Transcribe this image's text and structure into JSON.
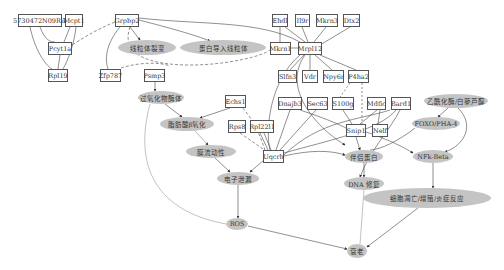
{
  "diagram": {
    "gene_nodes": [
      {
        "id": "n5730",
        "label": "5730472N09Rik",
        "x": 18,
        "y": 14,
        "w": 44
      },
      {
        "id": "mcpt1",
        "label": "Mcpt1",
        "x": 65,
        "y": 14,
        "w": 17
      },
      {
        "id": "pcyt1a",
        "label": "Pcyt1a",
        "x": 48,
        "y": 42,
        "w": 24
      },
      {
        "id": "rpl19",
        "label": "Rpl19",
        "x": 48,
        "y": 69,
        "w": 20
      },
      {
        "id": "grpbp2",
        "label": "Grpbp2",
        "x": 115,
        "y": 14,
        "w": 24
      },
      {
        "id": "zfp787",
        "label": "Zfp787",
        "x": 100,
        "y": 69,
        "w": 21
      },
      {
        "id": "psmp3",
        "label": "Psmp3",
        "x": 144,
        "y": 69,
        "w": 21
      },
      {
        "id": "ehdl",
        "label": "Ehdl",
        "x": 272,
        "y": 14,
        "w": 16
      },
      {
        "id": "il9r",
        "label": "Il9r",
        "x": 295,
        "y": 14,
        "w": 15
      },
      {
        "id": "mkrn3",
        "label": "Mkrn3",
        "x": 316,
        "y": 14,
        "w": 22
      },
      {
        "id": "dtx2",
        "label": "Dtx2",
        "x": 343,
        "y": 14,
        "w": 17
      },
      {
        "id": "mkrn1",
        "label": "Mkrn1",
        "x": 270,
        "y": 42,
        "w": 21
      },
      {
        "id": "mrpl12",
        "label": "Mrpl12",
        "x": 298,
        "y": 42,
        "w": 24
      },
      {
        "id": "slfn3",
        "label": "Slfn3",
        "x": 278,
        "y": 70,
        "w": 19
      },
      {
        "id": "vdr",
        "label": "Vdr",
        "x": 302,
        "y": 70,
        "w": 16
      },
      {
        "id": "npy6r",
        "label": "Npy6r",
        "x": 323,
        "y": 70,
        "w": 21
      },
      {
        "id": "p4ha2",
        "label": "P4ha2",
        "x": 348,
        "y": 70,
        "w": 21
      },
      {
        "id": "echs1",
        "label": "Echs1",
        "x": 225,
        "y": 95,
        "w": 21
      },
      {
        "id": "dnajb3",
        "label": "Dnajb3",
        "x": 278,
        "y": 97,
        "w": 24
      },
      {
        "id": "sec63",
        "label": "Sec63",
        "x": 307,
        "y": 97,
        "w": 21
      },
      {
        "id": "s100g",
        "label": "S100g",
        "x": 332,
        "y": 97,
        "w": 22
      },
      {
        "id": "mdfic",
        "label": "Mdfic",
        "x": 367,
        "y": 97,
        "w": 19
      },
      {
        "id": "bard1",
        "label": "Bard1",
        "x": 391,
        "y": 97,
        "w": 20
      },
      {
        "id": "rps8",
        "label": "Rps8",
        "x": 228,
        "y": 120,
        "w": 18
      },
      {
        "id": "rpl22l1",
        "label": "Rpl22l1",
        "x": 250,
        "y": 120,
        "w": 24
      },
      {
        "id": "snip1",
        "label": "Snip1",
        "x": 346,
        "y": 124,
        "w": 20
      },
      {
        "id": "nelf",
        "label": "Nelf",
        "x": 372,
        "y": 124,
        "w": 16
      },
      {
        "id": "uqcrh",
        "label": "Uqcrh",
        "x": 263,
        "y": 150,
        "w": 21
      }
    ],
    "process_nodes": [
      {
        "id": "fission",
        "label": "线粒体裂变",
        "x": 118,
        "y": 40,
        "w": 58,
        "h": 15
      },
      {
        "id": "import",
        "label": "蛋白导入线粒体",
        "x": 180,
        "y": 40,
        "w": 86,
        "h": 15
      },
      {
        "id": "perox",
        "label": "过氧化物酶体",
        "x": 138,
        "y": 91,
        "w": 46,
        "h": 13
      },
      {
        "id": "betaox",
        "label": "脂肪酸β氧化",
        "x": 160,
        "y": 117,
        "w": 54,
        "h": 14
      },
      {
        "id": "fluid",
        "label": "膜流动性",
        "x": 186,
        "y": 145,
        "w": 50,
        "h": 13
      },
      {
        "id": "leak",
        "label": "电子泄漏",
        "x": 217,
        "y": 172,
        "w": 42,
        "h": 13
      },
      {
        "id": "chap",
        "label": "伴侣蛋白",
        "x": 345,
        "y": 150,
        "w": 38,
        "h": 13
      },
      {
        "id": "dna",
        "label": "DNA 修复",
        "x": 344,
        "y": 177,
        "w": 40,
        "h": 13
      },
      {
        "id": "acet",
        "label": "乙酰化酶/白藜芦醇",
        "x": 424,
        "y": 94,
        "w": 64,
        "h": 14
      },
      {
        "id": "foxo",
        "label": "FOXO/PHA-4",
        "x": 412,
        "y": 117,
        "w": 48,
        "h": 13
      },
      {
        "id": "nfkb",
        "label": "NFk-Beta",
        "x": 413,
        "y": 150,
        "w": 40,
        "h": 13
      },
      {
        "id": "apop",
        "label": "细胞凋亡/增殖/炎症反应",
        "x": 363,
        "y": 188,
        "w": 128,
        "h": 20
      },
      {
        "id": "ros",
        "label": "ROS",
        "x": 226,
        "y": 218,
        "w": 22,
        "h": 12
      },
      {
        "id": "aging",
        "label": "衰老",
        "x": 347,
        "y": 244,
        "w": 20,
        "h": 14
      }
    ],
    "colors": {
      "ellipse_fill": "#c4c4c4",
      "edge": "#444444",
      "box_border": "#555555"
    }
  }
}
